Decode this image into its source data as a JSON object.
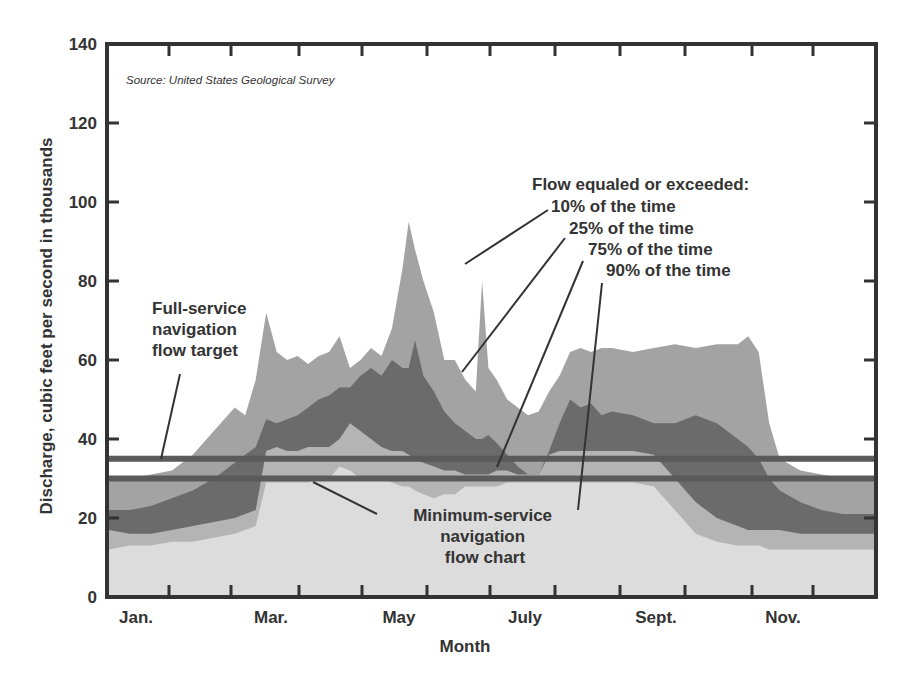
{
  "chart_data": {
    "type": "area",
    "title": "",
    "source": "Source: United States Geological Survey",
    "xlabel": "Month",
    "ylabel": "Discharge, cubic feet per second in thousands",
    "ylim": [
      0,
      140
    ],
    "yticks": [
      0,
      20,
      40,
      60,
      80,
      100,
      120,
      140
    ],
    "xtick_labels": [
      "Jan.",
      "Mar.",
      "May",
      "July",
      "Sept.",
      "Nov."
    ],
    "grid": false,
    "legend_title": "Flow equaled or exceeded:",
    "x_day": [
      0,
      10,
      20,
      30,
      40,
      50,
      60,
      65,
      70,
      75,
      80,
      85,
      90,
      95,
      100,
      105,
      110,
      115,
      120,
      125,
      130,
      135,
      140,
      143,
      146,
      150,
      155,
      160,
      165,
      170,
      175,
      178,
      181,
      185,
      190,
      195,
      200,
      205,
      210,
      215,
      220,
      225,
      230,
      235,
      240,
      250,
      260,
      270,
      280,
      290,
      300,
      305,
      310,
      315,
      320,
      330,
      340,
      350,
      365
    ],
    "series": [
      {
        "name": "10% of the time",
        "color": "#a3a3a3",
        "values": [
          30,
          30,
          31,
          32,
          36,
          42,
          48,
          46,
          55,
          72,
          62,
          60,
          61,
          59,
          61,
          62,
          66,
          58,
          60,
          63,
          61,
          68,
          83,
          95,
          88,
          80,
          72,
          60,
          60,
          55,
          52,
          80,
          58,
          55,
          50,
          48,
          46,
          47,
          52,
          56,
          62,
          63,
          62,
          63,
          63,
          62,
          63,
          64,
          63,
          64,
          64,
          66,
          62,
          44,
          35,
          32,
          31,
          30,
          30
        ]
      },
      {
        "name": "25% of the time",
        "color": "#6b6b6b",
        "values": [
          22,
          22,
          23,
          25,
          27,
          30,
          34,
          36,
          38,
          45,
          44,
          45,
          46,
          48,
          50,
          51,
          53,
          53,
          56,
          58,
          56,
          60,
          58,
          58,
          65,
          56,
          52,
          47,
          44,
          42,
          40,
          40,
          41,
          39,
          36,
          33,
          31,
          31,
          37,
          44,
          50,
          48,
          49,
          46,
          47,
          46,
          44,
          44,
          46,
          44,
          40,
          38,
          35,
          30,
          27,
          24,
          22,
          21,
          21
        ]
      },
      {
        "name": "75% of the time",
        "color": "#b4b4b4",
        "values": [
          17,
          16,
          16,
          17,
          18,
          19,
          20,
          21,
          22,
          37,
          38,
          37,
          37,
          38,
          38,
          38,
          40,
          44,
          42,
          40,
          38,
          37,
          37,
          36,
          35,
          34,
          33,
          32,
          32,
          31,
          31,
          31,
          31,
          32,
          32,
          31,
          31,
          31,
          36,
          37,
          37,
          37,
          37,
          37,
          37,
          37,
          36,
          30,
          24,
          20,
          18,
          17,
          17,
          17,
          17,
          16,
          16,
          16,
          16
        ]
      },
      {
        "name": "90% of the time",
        "color": "#dcdcdc",
        "values": [
          12,
          13,
          13,
          14,
          14,
          15,
          16,
          17,
          18,
          29,
          29,
          29,
          29,
          29,
          30,
          30,
          33,
          32,
          30,
          30,
          30,
          29,
          28,
          28,
          27,
          26,
          25,
          26,
          26,
          28,
          28,
          28,
          28,
          28,
          29,
          29,
          29,
          29,
          29,
          29,
          29,
          29,
          29,
          29,
          29,
          29,
          28,
          22,
          16,
          14,
          13,
          13,
          13,
          12,
          12,
          12,
          12,
          12,
          12
        ]
      }
    ],
    "reference_lines": [
      {
        "name": "Full-service navigation flow target",
        "value": 35,
        "color": "#5a5a5a"
      },
      {
        "name": "Minimum-service navigation flow chart",
        "value": 30,
        "color": "#5a5a5a"
      }
    ]
  },
  "annotations": {
    "legend_title": "Flow equaled or exceeded:",
    "p10": "10% of the time",
    "p25": "25% of the time",
    "p75": "75% of the time",
    "p90": "90% of the time",
    "full_service": [
      "Full-service",
      "navigation",
      "flow target"
    ],
    "minimum_service": [
      "Minimum-service",
      "navigation",
      "flow chart"
    ]
  }
}
